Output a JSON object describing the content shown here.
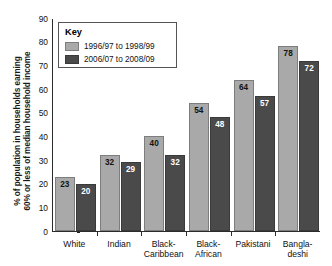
{
  "chart_data": {
    "type": "bar",
    "title": "",
    "xlabel": "",
    "ylabel": "% of population in households earning 60% or less of median household income",
    "ylabel_lines": [
      "% of population in households earning",
      "60% or less of median household income"
    ],
    "ylim": [
      0,
      90
    ],
    "yticks": [
      0,
      10,
      20,
      30,
      40,
      50,
      60,
      70,
      80,
      90
    ],
    "ytick_labels": [
      "0",
      "10",
      "20",
      "30",
      "40",
      "50",
      "60",
      "70",
      "80",
      "90"
    ],
    "grid": false,
    "legend_position": "top-left",
    "legend_title": "Key",
    "categories": [
      "White",
      "Indian",
      "Black-Caribbean",
      "Black-African",
      "Pakistani",
      "Bangla-deshi"
    ],
    "category_lines": [
      [
        "White"
      ],
      [
        "Indian"
      ],
      [
        "Black-",
        "Caribbean"
      ],
      [
        "Black-",
        "African"
      ],
      [
        "Pakistani"
      ],
      [
        "Bangla-",
        "deshi"
      ]
    ],
    "series": [
      {
        "name": "1996/97 to 1998/99",
        "color": "#a9a9a9",
        "values": [
          23,
          32,
          40,
          54,
          64,
          78
        ]
      },
      {
        "name": "2006/07 to 2008/09",
        "color": "#4a4a4a",
        "values": [
          20,
          29,
          32,
          48,
          57,
          72
        ]
      }
    ]
  },
  "legend": {
    "title": "Key",
    "items": [
      {
        "label": "1996/97 to 1998/99",
        "swatch": "light"
      },
      {
        "label": "2006/07 to 2008/09",
        "swatch": "dark"
      }
    ]
  },
  "axis": {
    "y_title_line1": "% of population in households earning",
    "y_title_line2": "60% or less of median household income",
    "y_ticks": [
      "90",
      "80",
      "70",
      "60",
      "50",
      "40",
      "30",
      "20",
      "10",
      "0"
    ]
  },
  "groups": [
    {
      "category": "White",
      "line1": "White",
      "line2": "",
      "light": "23",
      "dark": "20"
    },
    {
      "category": "Indian",
      "line1": "Indian",
      "line2": "",
      "light": "32",
      "dark": "29"
    },
    {
      "category": "Black-Caribbean",
      "line1": "Black-",
      "line2": "Caribbean",
      "light": "40",
      "dark": "32"
    },
    {
      "category": "Black-African",
      "line1": "Black-",
      "line2": "African",
      "light": "54",
      "dark": "48"
    },
    {
      "category": "Pakistani",
      "line1": "Pakistani",
      "line2": "",
      "light": "64",
      "dark": "57"
    },
    {
      "category": "Bangladeshi",
      "line1": "Bangla-",
      "line2": "deshi",
      "light": "78",
      "dark": "72"
    }
  ],
  "colors": {
    "series_light": "#a9a9a9",
    "series_dark": "#4a4a4a",
    "axis": "#2b2b2b",
    "background": "#ffffff"
  }
}
